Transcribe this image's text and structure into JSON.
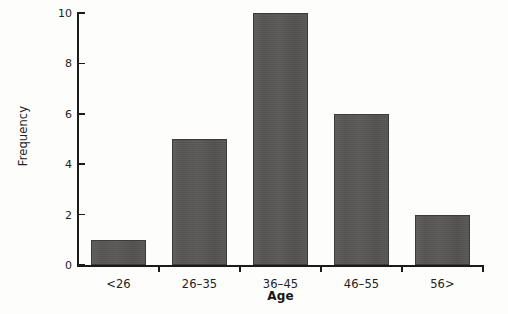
{
  "chart_data": {
    "type": "bar",
    "title": "",
    "subtitle": "",
    "xlabel": "Age",
    "ylabel": "Frequency",
    "categories": [
      "<26",
      "26–35",
      "36–45",
      "46–55",
      "56>"
    ],
    "values": [
      1,
      5,
      10,
      6,
      2
    ],
    "series": [
      {
        "name": "Frequency",
        "values": [
          1,
          5,
          10,
          6,
          2
        ]
      }
    ],
    "ylim": [
      0,
      10
    ],
    "yticks": [
      0,
      2,
      4,
      6,
      8,
      10
    ],
    "ytick_labels": [
      "0",
      "2",
      "4",
      "6",
      "8",
      "10"
    ],
    "grid": false,
    "legend": false,
    "legend_position": "none",
    "bar_color": "#555452",
    "bar_edge_color": "#3c3b3a",
    "axis_color": "#1b1b1b",
    "background_color": "#fdfdfc",
    "annotations": []
  }
}
